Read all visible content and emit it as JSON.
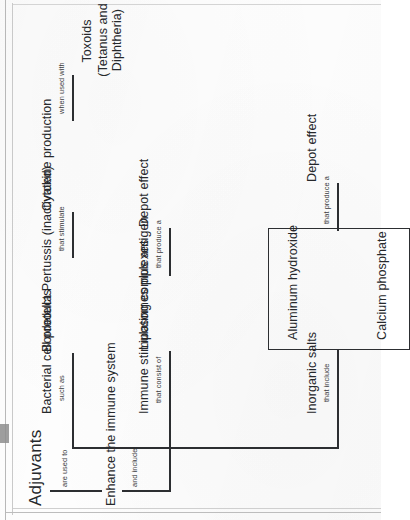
{
  "document": {
    "kind": "scanned-concept-map",
    "title": "Adjuvants",
    "orientation_note": "page content reads sideways (rotated 90 degrees)"
  },
  "map": {
    "root": "Adjuvants",
    "linkers": {
      "are_used_to": "are used to",
      "and_include": "and include",
      "that_include": "that include",
      "that_consist_of": "that consist of",
      "such_as": "such as",
      "that_produce_a_1": "that produce a",
      "that_produce_a_2": "that produce a",
      "that_stimulate": "that stimulate",
      "when_used_with": "when used with"
    },
    "nodes": {
      "enhance": "Enhance the immune system",
      "inorganic_salts": "Inorganic salts",
      "calcium_phosphate": "Calcium phosphate",
      "aluminum_hydroxide": "Aluminum hydroxide",
      "depot_effect_salts": "Depot effect",
      "immune_stimulating_complexes": "Immune stimulating complexes",
      "liposomes_plus_antigen": "Liposomes plus antigen",
      "depot_effect_isc": "Depot effect",
      "bacterial_cell_products": "Bacterial cell products",
      "bordetella": "Bordetella Pertussis (inactivated)",
      "cytokine_production": "Cytokine production",
      "toxoids_line1": "Toxoids",
      "toxoids_line2": "(Tetanus and Diphtheria)"
    }
  },
  "colors": {
    "ink": "#2c2e31",
    "linker_ink": "#3a3c40",
    "paper": "#fdfdfd",
    "frame": "#bdbdbd"
  }
}
